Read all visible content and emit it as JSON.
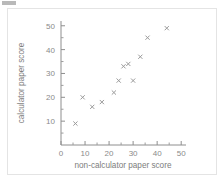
{
  "chart_data": {
    "type": "scatter",
    "title": "",
    "xlabel": "non-calculator paper score",
    "ylabel": "calculator paper score",
    "xlim": [
      0,
      52
    ],
    "ylim": [
      0,
      52
    ],
    "xticks": [
      0,
      10,
      20,
      30,
      40,
      50
    ],
    "yticks": [
      10,
      20,
      30,
      40,
      50
    ],
    "xtick_labels": [
      "0",
      "10",
      "20",
      "30",
      "40",
      "50"
    ],
    "ytick_labels": [
      "10",
      "20",
      "30",
      "40",
      "50"
    ],
    "minor_tick_step": 5,
    "grid": false,
    "legend": null,
    "marker": "x-cross",
    "marker_color": "#9a9a9a",
    "points": [
      {
        "x": 6,
        "y": 9
      },
      {
        "x": 9,
        "y": 20
      },
      {
        "x": 13,
        "y": 16
      },
      {
        "x": 17,
        "y": 18
      },
      {
        "x": 22,
        "y": 22
      },
      {
        "x": 24,
        "y": 27
      },
      {
        "x": 26,
        "y": 33
      },
      {
        "x": 28,
        "y": 34
      },
      {
        "x": 30,
        "y": 27
      },
      {
        "x": 33,
        "y": 37
      },
      {
        "x": 36,
        "y": 45
      },
      {
        "x": 44,
        "y": 49
      }
    ]
  },
  "figure": {
    "background": "#ffffff",
    "border_color": "#e4e4e4",
    "axis_color": "#8e8e8e",
    "text_color": "#8a8a8a"
  }
}
